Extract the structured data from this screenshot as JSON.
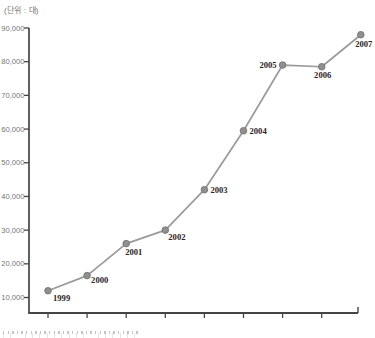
{
  "unit_label": "(단위 : 대)",
  "chart_data": {
    "type": "line",
    "title": "",
    "xlabel": "",
    "ylabel": "(단위 : 대)",
    "categories": [
      "1999",
      "2000",
      "2001",
      "2002",
      "2003",
      "2004",
      "2005",
      "2006",
      "2007"
    ],
    "values": [
      12000,
      16500,
      26000,
      30000,
      42000,
      59500,
      79000,
      78500,
      88000
    ],
    "y_ticks": [
      10000,
      20000,
      30000,
      40000,
      50000,
      60000,
      70000,
      80000,
      90000
    ],
    "y_tick_labels": [
      "10,000",
      "20,000",
      "30,000",
      "40,000",
      "50,000",
      "60,000",
      "70,000",
      "80,000",
      "90,000"
    ],
    "ylim": [
      5000,
      90000
    ],
    "grid": false,
    "legend_position": "none",
    "point_label_offsets": [
      {
        "dx": 5,
        "dy": 10,
        "anchor": "start"
      },
      {
        "dx": 4,
        "dy": 7,
        "anchor": "start"
      },
      {
        "dx": -1,
        "dy": 11,
        "anchor": "start"
      },
      {
        "dx": 3,
        "dy": 10,
        "anchor": "start"
      },
      {
        "dx": 6,
        "dy": 3,
        "anchor": "start"
      },
      {
        "dx": 6,
        "dy": 3.5,
        "anchor": "start"
      },
      {
        "dx": -6,
        "dy": 3,
        "anchor": "end"
      },
      {
        "dx": 1,
        "dy": 11,
        "anchor": "middle"
      },
      {
        "dx": 3,
        "dy": 12.5,
        "anchor": "middle"
      }
    ],
    "colors": {
      "line": "#9a9a9a",
      "point_fill": "#8f8f8f",
      "point_stroke": "#757575",
      "axis": "#454545",
      "y_tick_label": "#757575",
      "year_label": "#302424",
      "unit_label": "#757575"
    }
  }
}
